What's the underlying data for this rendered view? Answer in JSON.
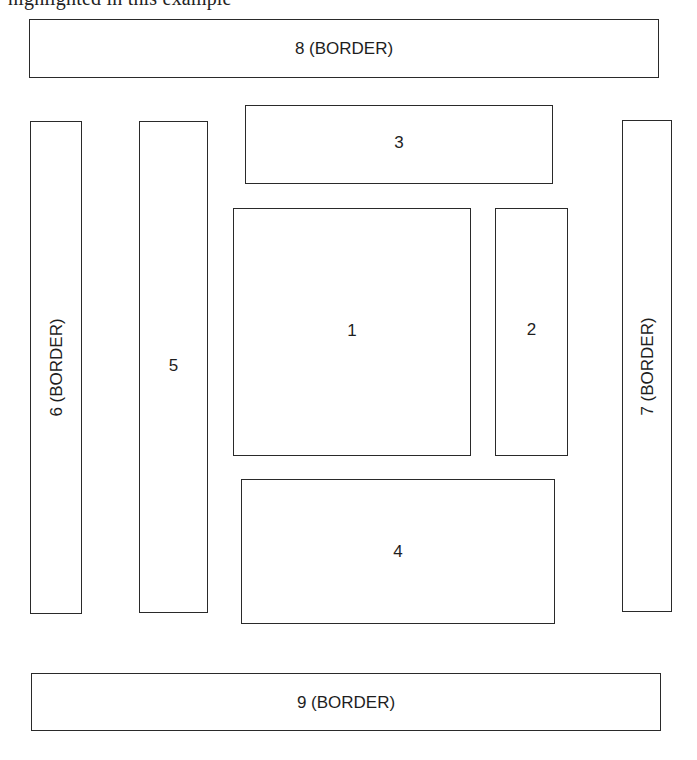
{
  "caption_cutoff": "highlighted in this example",
  "regions": [
    {
      "id": "8",
      "label": "8 (BORDER)",
      "role": "border-top"
    },
    {
      "id": "6",
      "label": "6 (BORDER)",
      "role": "border-left"
    },
    {
      "id": "5",
      "label": "5",
      "role": "left-column"
    },
    {
      "id": "3",
      "label": "3",
      "role": "top-band"
    },
    {
      "id": "1",
      "label": "1",
      "role": "main-content"
    },
    {
      "id": "2",
      "label": "2",
      "role": "right-column"
    },
    {
      "id": "4",
      "label": "4",
      "role": "bottom-band"
    },
    {
      "id": "7",
      "label": "7 (BORDER)",
      "role": "border-right"
    },
    {
      "id": "9",
      "label": "9 (BORDER)",
      "role": "border-bottom"
    }
  ],
  "colors": {
    "stroke": "#2a2a2a",
    "text": "#1e1e1e",
    "background": "#ffffff"
  }
}
